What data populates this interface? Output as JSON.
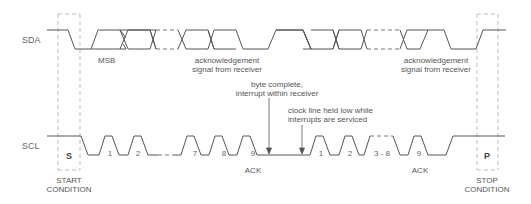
{
  "signals": {
    "sda": "SDA",
    "scl": "SCL"
  },
  "sda_labels": {
    "msb": "MSB",
    "ack1_line1": "acknowledgement",
    "ack1_line2": "signal from receiver",
    "ack2_line1": "acknowledgement",
    "ack2_line2": "signal from receiver"
  },
  "annotations": {
    "byte_complete_line1": "byte complete,",
    "byte_complete_line2": "interrupt within receiver",
    "clock_hold_line1": "clock line held low while",
    "clock_hold_line2": "interrupts are serviced"
  },
  "scl_labels": {
    "start_box": "S",
    "stop_box": "P",
    "pulses": [
      "1",
      "2",
      "7",
      "8",
      "9",
      "1",
      "2",
      "3 - 8",
      "9"
    ],
    "ack1": "ACK",
    "ack2": "ACK"
  },
  "conditions": {
    "start_line1": "START",
    "start_line2": "CONDITION",
    "stop_line1": "STOP",
    "stop_line2": "CONDITION"
  },
  "colors": {
    "line": "#555555",
    "dashed": "#999999",
    "text": "#555555"
  }
}
